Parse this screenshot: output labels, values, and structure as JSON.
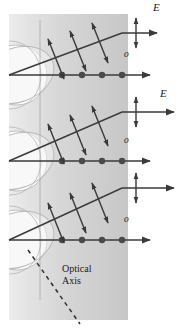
{
  "figure": {
    "title_semantic": "double-refraction-huygens-construction",
    "canvas": {
      "width": 182,
      "height": 334,
      "background": "#ffffff"
    },
    "crystal": {
      "name": "uniaxial-crystal-slab",
      "x": 9,
      "y": 14,
      "width": 119,
      "height": 306,
      "gradient_from": "#e9e9e9",
      "gradient_mid": "#d4d4d4",
      "gradient_to": "#c9c9c9"
    },
    "stroke_color": "#3a3a3a",
    "wavelet_fill": "#ffffff",
    "wavelet_stroke": "#b5b5b5",
    "vertical_guide": {
      "name": "entry-reference-line",
      "x": 40,
      "color": "#a9a9a9"
    }
  },
  "labels": {
    "extraordinary_1": "E",
    "extraordinary_2": "E",
    "ordinary_1": "o",
    "ordinary_2": "o",
    "ordinary_3": "o",
    "optical_axis_line1": "Optical",
    "optical_axis_line2": "Axis"
  },
  "ray_groups": [
    {
      "name": "ray-group-1",
      "entry_y": 75,
      "ordinary": {
        "label": "o",
        "label_x": 124,
        "label_y": 56,
        "y": 75,
        "x_start": 9,
        "x_end": 148,
        "dot_count": 4,
        "dots_x": [
          62,
          82,
          102,
          122
        ]
      },
      "extraordinary": {
        "label": "E",
        "label_x": 152,
        "label_y": 8,
        "x_start": 9,
        "y_start": 75,
        "x_bend": 122,
        "y_bend": 33,
        "x_end": 155,
        "polarization_marks": 3,
        "marks_t": [
          0.45,
          0.64,
          0.83
        ]
      }
    },
    {
      "name": "ray-group-2",
      "entry_y": 161,
      "ordinary": {
        "label": "o",
        "label_x": 124,
        "label_y": 142,
        "y": 161,
        "x_start": 9,
        "x_end": 148,
        "dot_count": 4,
        "dots_x": [
          62,
          82,
          102,
          122
        ]
      },
      "extraordinary": {
        "label": "E",
        "label_x": 160,
        "label_y": 95,
        "x_start": 9,
        "y_start": 161,
        "x_bend": 122,
        "y_bend": 112,
        "x_end": 172,
        "polarization_marks": 3,
        "marks_t": [
          0.45,
          0.64,
          0.83
        ]
      }
    },
    {
      "name": "ray-group-3",
      "entry_y": 240,
      "ordinary": {
        "label": "o",
        "label_x": 124,
        "label_y": 221,
        "y": 240,
        "x_start": 9,
        "x_end": 148,
        "dot_count": 4,
        "dots_x": [
          62,
          82,
          102,
          122
        ]
      },
      "extraordinary": {
        "label": "",
        "label_x": 0,
        "label_y": 0,
        "x_start": 9,
        "y_start": 240,
        "x_bend": 122,
        "y_bend": 188,
        "x_end": 172,
        "polarization_marks": 3,
        "marks_t": [
          0.45,
          0.64,
          0.83
        ]
      }
    }
  ],
  "exit_polarization_crosses": [
    {
      "name": "exit-cross-1",
      "x": 136,
      "y": 33,
      "arm": 16
    },
    {
      "name": "exit-cross-2",
      "x": 136,
      "y": 112,
      "arm": 16
    },
    {
      "name": "exit-cross-3",
      "x": 136,
      "y": 188,
      "arm": 16
    }
  ],
  "optical_axis": {
    "name": "optical-axis-dashed-line",
    "x1": 28,
    "y1": 250,
    "x2": 78,
    "y2": 322,
    "dash": "4 4",
    "label_x": 65,
    "label_y": 266
  }
}
